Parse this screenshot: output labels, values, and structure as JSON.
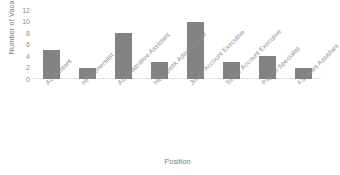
{
  "chart_data": {
    "type": "bar",
    "title": "",
    "xlabel": "Position",
    "ylabel": "Number of Vacancies",
    "categories": [
      "Accountant",
      "HR Generalist",
      "Administrative Assistant",
      "Help Desk Administrator",
      "Junior Account Executive",
      "Senior Account Executive",
      "Payroll Specialist",
      "Facilities Assistant"
    ],
    "values": [
      5,
      2,
      8,
      3,
      10,
      3,
      4,
      2
    ],
    "ylim": [
      0,
      12
    ],
    "ytick_labels": [
      "12",
      "10",
      "8",
      "6",
      "4",
      "2",
      "0"
    ],
    "ytick_values": [
      12,
      10,
      8,
      6,
      4,
      2,
      0
    ],
    "grid": false,
    "legend": false,
    "legend_position": "none",
    "bar_color": "#828282",
    "background_color": "#ffffff",
    "xtick_rotation": -45
  }
}
